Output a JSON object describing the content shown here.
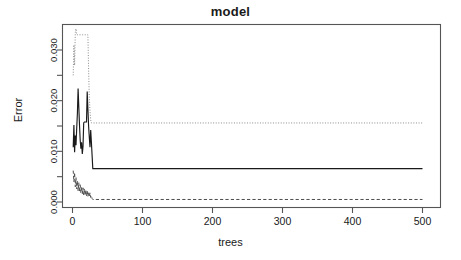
{
  "chart_data": {
    "type": "line",
    "title": "model",
    "xlabel": "trees",
    "ylabel": "Error",
    "xlim": [
      0,
      500
    ],
    "ylim": [
      0.0,
      0.0345
    ],
    "grid": false,
    "legend": "none",
    "x_ticks": [
      0,
      100,
      200,
      300,
      400,
      500
    ],
    "x_tick_labels": [
      "0",
      "100",
      "200",
      "300",
      "400",
      "500"
    ],
    "y_ticks": [
      0.0,
      0.005,
      0.01,
      0.015,
      0.02,
      0.025,
      0.03
    ],
    "y_tick_labels": [
      "0.000",
      "",
      "0.010",
      "",
      "0.020",
      "",
      "0.030"
    ],
    "y_labeled_ticks": [
      {
        "value": 0.0,
        "label": "0.000"
      },
      {
        "value": 0.01,
        "label": "0.010"
      },
      {
        "value": 0.02,
        "label": "0.020"
      },
      {
        "value": 0.03,
        "label": "0.030"
      }
    ],
    "series": [
      {
        "name": "OOB",
        "style": "solid",
        "color": "#1a1a1a",
        "final_value": 0.0066,
        "points": [
          [
            1,
            0.0108
          ],
          [
            2,
            0.0152
          ],
          [
            3,
            0.0098
          ],
          [
            4,
            0.0131
          ],
          [
            5,
            0.0112
          ],
          [
            6,
            0.0145
          ],
          [
            7,
            0.0175
          ],
          [
            8,
            0.0224
          ],
          [
            9,
            0.0188
          ],
          [
            10,
            0.0152
          ],
          [
            11,
            0.0122
          ],
          [
            12,
            0.0105
          ],
          [
            13,
            0.0118
          ],
          [
            14,
            0.0095
          ],
          [
            15,
            0.0109
          ],
          [
            16,
            0.0156
          ],
          [
            17,
            0.0158
          ],
          [
            18,
            0.0158
          ],
          [
            19,
            0.0158
          ],
          [
            20,
            0.0158
          ],
          [
            21,
            0.0218
          ],
          [
            22,
            0.0184
          ],
          [
            23,
            0.015
          ],
          [
            24,
            0.0128
          ],
          [
            25,
            0.0108
          ],
          [
            26,
            0.0142
          ],
          [
            27,
            0.0118
          ],
          [
            28,
            0.0092
          ],
          [
            29,
            0.0066
          ],
          [
            30,
            0.0066
          ],
          [
            60,
            0.0066
          ],
          [
            100,
            0.0066
          ],
          [
            200,
            0.0066
          ],
          [
            300,
            0.0066
          ],
          [
            400,
            0.0066
          ],
          [
            500,
            0.0066
          ]
        ]
      },
      {
        "name": "class-1",
        "style": "dotted",
        "color": "#8c8c8c",
        "final_value": 0.0156,
        "points": [
          [
            1,
            0.025
          ],
          [
            2,
            0.031
          ],
          [
            3,
            0.027
          ],
          [
            4,
            0.0335
          ],
          [
            5,
            0.0342
          ],
          [
            6,
            0.033
          ],
          [
            7,
            0.033
          ],
          [
            8,
            0.033
          ],
          [
            9,
            0.033
          ],
          [
            10,
            0.033
          ],
          [
            11,
            0.033
          ],
          [
            12,
            0.033
          ],
          [
            13,
            0.033
          ],
          [
            14,
            0.033
          ],
          [
            15,
            0.033
          ],
          [
            16,
            0.033
          ],
          [
            17,
            0.033
          ],
          [
            18,
            0.033
          ],
          [
            19,
            0.033
          ],
          [
            20,
            0.033
          ],
          [
            21,
            0.033
          ],
          [
            22,
            0.033
          ],
          [
            23,
            0.0262
          ],
          [
            24,
            0.0206
          ],
          [
            25,
            0.018
          ],
          [
            26,
            0.0162
          ],
          [
            27,
            0.0156
          ],
          [
            28,
            0.0156
          ],
          [
            29,
            0.0156
          ],
          [
            30,
            0.0156
          ],
          [
            100,
            0.0156
          ],
          [
            200,
            0.0156
          ],
          [
            300,
            0.0156
          ],
          [
            400,
            0.0156
          ],
          [
            500,
            0.0156
          ]
        ]
      },
      {
        "name": "class-2",
        "style": "dashed",
        "color": "#4d4d4d",
        "final_value": 0.0005,
        "points": [
          [
            1,
            0.0062
          ],
          [
            2,
            0.004
          ],
          [
            3,
            0.0058
          ],
          [
            4,
            0.003
          ],
          [
            5,
            0.0048
          ],
          [
            6,
            0.0026
          ],
          [
            7,
            0.0042
          ],
          [
            8,
            0.0022
          ],
          [
            9,
            0.0038
          ],
          [
            10,
            0.002
          ],
          [
            11,
            0.0034
          ],
          [
            12,
            0.0018
          ],
          [
            13,
            0.003
          ],
          [
            14,
            0.0016
          ],
          [
            15,
            0.0028
          ],
          [
            16,
            0.0014
          ],
          [
            17,
            0.0026
          ],
          [
            18,
            0.0013
          ],
          [
            19,
            0.0024
          ],
          [
            20,
            0.0012
          ],
          [
            21,
            0.0022
          ],
          [
            22,
            0.0011
          ],
          [
            23,
            0.002
          ],
          [
            24,
            0.001
          ],
          [
            25,
            0.0018
          ],
          [
            26,
            0.0009
          ],
          [
            27,
            0.0012
          ],
          [
            28,
            0.0007
          ],
          [
            29,
            0.0005
          ],
          [
            30,
            0.0005
          ],
          [
            100,
            0.0005
          ],
          [
            200,
            0.0005
          ],
          [
            300,
            0.0005
          ],
          [
            400,
            0.0005
          ],
          [
            500,
            0.0005
          ]
        ]
      }
    ]
  },
  "axis": {
    "box_color": "#555555",
    "tick_color": "#555555"
  }
}
